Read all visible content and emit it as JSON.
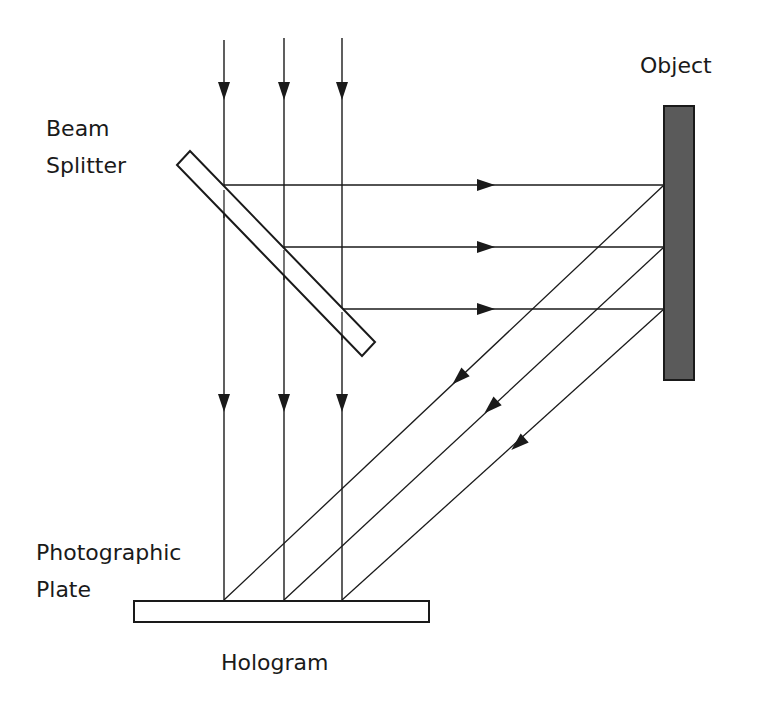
{
  "diagram": {
    "labels": {
      "object": "Object",
      "beam_splitter_line1": "Beam",
      "beam_splitter_line2": "Splitter",
      "plate_line1": "Photographic",
      "plate_line2": "Plate",
      "hologram": "Hologram"
    },
    "colors": {
      "line": "#1a1a1a",
      "object_fill": "#5a5a5a",
      "background": "#ffffff"
    },
    "components": [
      {
        "id": "beam-splitter",
        "shape": "tilted-rectangle",
        "fill": "#ffffff"
      },
      {
        "id": "object",
        "shape": "rectangle",
        "fill": "#5a5a5a"
      },
      {
        "id": "photographic-plate",
        "shape": "rectangle",
        "fill": "#ffffff"
      }
    ],
    "beams": {
      "incident": 3,
      "reference_vertical": 3,
      "to_object_horizontal": 3,
      "object_reflected_diagonal": 3
    }
  }
}
